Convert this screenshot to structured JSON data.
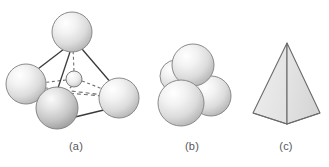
{
  "figure": {
    "background_color": "#ffffff",
    "width": 329,
    "height": 167
  },
  "captions": {
    "a": "(a)",
    "b": "(b)",
    "c": "(c)"
  },
  "panels": [
    {
      "id": "a",
      "label": "(a)",
      "name": "ball-and-stick-tetrahedron",
      "description": "Four large spheres at tetrahedron vertices with a small central sphere, joined by solid and dashed bonds",
      "spheres": [
        {
          "name": "sphere-top",
          "cx": 72,
          "cy": 32,
          "r": 20,
          "shade": "light"
        },
        {
          "name": "sphere-left",
          "cx": 26,
          "cy": 84,
          "r": 20,
          "shade": "light"
        },
        {
          "name": "sphere-right",
          "cx": 119,
          "cy": 98,
          "r": 20,
          "shade": "light"
        },
        {
          "name": "sphere-front-bottom",
          "cx": 57,
          "cy": 108,
          "r": 21,
          "shade": "dark"
        },
        {
          "name": "sphere-center-small",
          "cx": 74,
          "cy": 79,
          "r": 8,
          "shade": "light"
        }
      ],
      "bonds_solid": [
        {
          "from": "sphere-top",
          "to": "sphere-left"
        },
        {
          "from": "sphere-top",
          "to": "sphere-right"
        },
        {
          "from": "sphere-top",
          "to": "sphere-front-bottom"
        },
        {
          "from": "sphere-left",
          "to": "sphere-front-bottom"
        },
        {
          "from": "sphere-front-bottom",
          "to": "sphere-right"
        }
      ],
      "bonds_dashed": [
        {
          "from": "sphere-top",
          "to": "sphere-center-small"
        },
        {
          "from": "sphere-left",
          "to": "sphere-center-small"
        },
        {
          "from": "sphere-right",
          "to": "sphere-center-small"
        },
        {
          "from": "sphere-front-bottom",
          "to": "sphere-center-small"
        },
        {
          "from": "sphere-left",
          "to": "sphere-right",
          "note": "hidden rear edge"
        }
      ]
    },
    {
      "id": "b",
      "label": "(b)",
      "name": "close-packed-sphere-cluster",
      "description": "Four touching spheres in close-packed tetrahedral arrangement",
      "spheres": [
        {
          "name": "sphere-back-left",
          "cx": 176,
          "cy": 76,
          "r": 16,
          "shade": "light"
        },
        {
          "name": "sphere-top",
          "cx": 193,
          "cy": 65,
          "r": 21,
          "shade": "light"
        },
        {
          "name": "sphere-right",
          "cx": 211,
          "cy": 96,
          "r": 20,
          "shade": "light"
        },
        {
          "name": "sphere-front-left",
          "cx": 181,
          "cy": 103,
          "r": 23,
          "shade": "light"
        }
      ]
    },
    {
      "id": "c",
      "label": "(c)",
      "name": "solid-tetrahedron",
      "description": "Shaded solid tetrahedron outline",
      "vertices": {
        "apex": {
          "x": 287,
          "y": 43
        },
        "base_left": {
          "x": 253,
          "y": 113
        },
        "base_right": {
          "x": 320,
          "y": 113
        },
        "base_front": {
          "x": 287,
          "y": 124
        }
      },
      "faces": [
        {
          "name": "face-left",
          "fill": "#ececec"
        },
        {
          "name": "face-right",
          "fill": "#e0e0e0"
        }
      ]
    }
  ],
  "colors": {
    "sphere_highlight": "#ffffff",
    "sphere_light_mid": "#e3e3e3",
    "sphere_light_edge": "#b8b8b8",
    "sphere_dark_mid": "#cfcfcf",
    "sphere_dark_edge": "#9a9a9a",
    "sphere_outline": "#7d7d7d",
    "bond_solid": "#3a3a3a",
    "bond_dashed": "#6e6e6e",
    "tetra_outline": "#6b6b6b",
    "tetra_face_left": "#ececec",
    "tetra_face_right": "#e0e0e0",
    "caption_text": "#58585a",
    "background": "#ffffff"
  }
}
